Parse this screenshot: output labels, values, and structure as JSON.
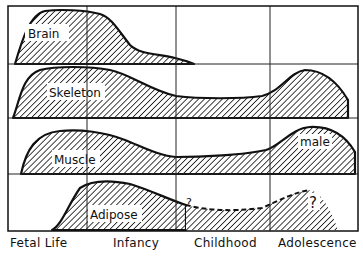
{
  "diagram": {
    "rows": [
      {
        "label": "Brain"
      },
      {
        "label": "Skeleton"
      },
      {
        "label": "Muscle",
        "annotation": "male"
      },
      {
        "label": "Adipose",
        "uncertain_marks": [
          "?",
          "?"
        ]
      }
    ],
    "periods": [
      {
        "label": "Fetal Life"
      },
      {
        "label": "Infancy"
      },
      {
        "label": "Childhood"
      },
      {
        "label": "Adolescence"
      }
    ],
    "colors": {
      "ink": "#111111",
      "background": "#ffffff"
    }
  }
}
